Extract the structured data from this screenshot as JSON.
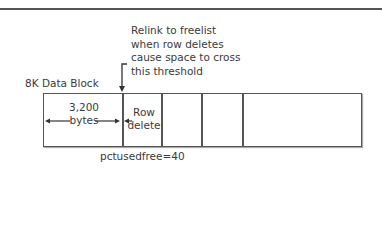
{
  "annotation": {
    "line1": "Relink to freelist",
    "line2": "when row deletes",
    "line3": "cause space to cross",
    "line4": "this threshold"
  },
  "block_label": "8K Data Block",
  "segment1": {
    "size": "3,200",
    "unit": "bytes"
  },
  "segment2": {
    "line1": "Row",
    "line2": "delete"
  },
  "footer": "pctusedfree=40"
}
